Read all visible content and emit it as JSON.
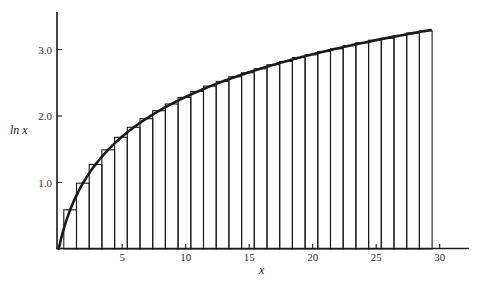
{
  "chart_data": {
    "type": "bar",
    "title": "",
    "xlabel": "x",
    "ylabel": "ln x",
    "xlim": [
      0,
      32
    ],
    "ylim": [
      0,
      3.7
    ],
    "grid": false,
    "legend": null,
    "x_ticks": [
      5,
      10,
      15,
      20,
      25,
      30
    ],
    "x_tick_labels": [
      "5",
      "10",
      "15",
      "20",
      "25",
      "30"
    ],
    "y_ticks": [
      1.0,
      2.0,
      3.0
    ],
    "y_tick_labels": [
      "1.0",
      "2.0",
      "3.0"
    ],
    "rect_edges_start": 0.4,
    "rect_width": 1,
    "rect_midpoints": [
      0.9,
      1.9,
      2.9,
      3.9,
      4.9,
      5.9,
      6.9,
      7.9,
      8.9,
      9.9,
      10.9,
      11.9,
      12.9,
      13.9,
      14.9,
      15.9,
      16.9,
      17.9,
      18.9,
      19.9,
      20.9,
      21.9,
      22.9,
      23.9,
      24.9,
      25.9,
      26.9,
      27.9,
      28.9
    ],
    "rect_heights": [
      0.59,
      0.99,
      1.27,
      1.49,
      1.68,
      1.83,
      1.96,
      2.08,
      2.18,
      2.28,
      2.37,
      2.45,
      2.52,
      2.59,
      2.65,
      2.71,
      2.77,
      2.82,
      2.88,
      2.92,
      2.97,
      3.01,
      3.06,
      3.1,
      3.14,
      3.17,
      3.21,
      3.25,
      3.28
    ],
    "series": [
      {
        "name": "ln x curve",
        "type": "line",
        "x": [
          0,
          0.25,
          0.5,
          1,
          1.5,
          2,
          3,
          4,
          5,
          6,
          7,
          8,
          9,
          10,
          12,
          14,
          16,
          18,
          20,
          22,
          24,
          26,
          28,
          29.4
        ],
        "values": [
          0,
          0.2,
          0.36,
          0.63,
          0.84,
          1.02,
          1.3,
          1.51,
          1.68,
          1.82,
          1.95,
          2.07,
          2.17,
          2.27,
          2.43,
          2.58,
          2.7,
          2.81,
          2.91,
          3.0,
          3.09,
          3.17,
          3.24,
          3.29
        ]
      }
    ]
  },
  "colors": {
    "ink": "#1a1a1a",
    "background": "#ffffff"
  }
}
